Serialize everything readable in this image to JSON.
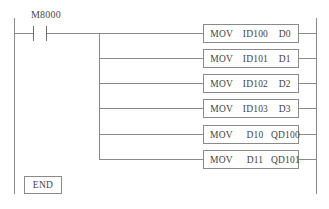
{
  "diagram": {
    "line_color": "#8a8a8a",
    "text_color": "#3f3f3f",
    "background": "#ffffff",
    "contact": {
      "label": "M8000",
      "type": "normally-open-contact"
    },
    "end_block": {
      "label": "END"
    },
    "instructions": [
      {
        "operation": "MOV",
        "source": "ID100",
        "destination": "D0"
      },
      {
        "operation": "MOV",
        "source": "ID101",
        "destination": "D1"
      },
      {
        "operation": "MOV",
        "source": "ID102",
        "destination": "D2"
      },
      {
        "operation": "MOV",
        "source": "ID103",
        "destination": "D3"
      },
      {
        "operation": "MOV",
        "source": "D10",
        "destination": "QD100"
      },
      {
        "operation": "MOV",
        "source": "D11",
        "destination": "QD101"
      }
    ]
  }
}
